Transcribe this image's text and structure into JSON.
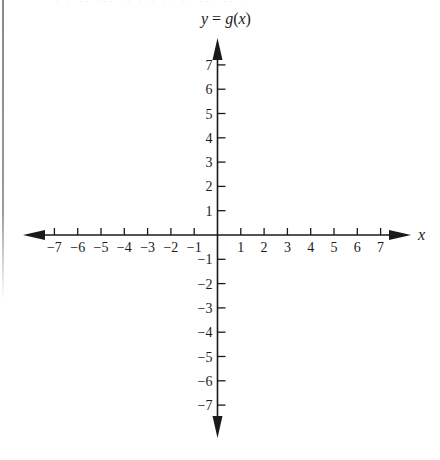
{
  "chart_data": {
    "type": "line",
    "title": "",
    "xlabel": "x",
    "ylabel": "y = g(x)",
    "xlim": [
      -7,
      7
    ],
    "ylim": [
      -7,
      7
    ],
    "x_ticks": [
      -7,
      -6,
      -5,
      -4,
      -3,
      -2,
      -1,
      1,
      2,
      3,
      4,
      5,
      6,
      7
    ],
    "y_ticks": [
      7,
      6,
      5,
      4,
      3,
      2,
      1,
      -1,
      -2,
      -3,
      -4,
      -5,
      -6,
      -7
    ],
    "x_tick_labels": [
      "−7",
      "−6",
      "−5",
      "−4",
      "−3",
      "−2",
      "−1",
      "1",
      "2",
      "3",
      "4",
      "5",
      "6",
      "7"
    ],
    "y_tick_labels": [
      "7",
      "6",
      "5",
      "4",
      "3",
      "2",
      "1",
      "−1",
      "−2",
      "−3",
      "−4",
      "−5",
      "−6",
      "−7"
    ],
    "series": [],
    "grid": false,
    "legend": null,
    "arrows": {
      "x_axis": "both-ends",
      "y_axis": "both-ends"
    }
  },
  "axes": {
    "x_label": "x",
    "y_label_parts": {
      "lhs": "y",
      "eq": " = ",
      "fn": "g",
      "paren_open": "(",
      "var": "x",
      "paren_close": ")"
    }
  },
  "layout": {
    "origin_px": [
      217.5,
      235
    ],
    "unit_x_px": 23.3,
    "unit_y_px": 24.3,
    "x_arrow_left_tip": 23,
    "x_arrow_right_tip": 411,
    "y_arrow_top_tip": 38,
    "y_arrow_bottom_tip": 438,
    "stroke": "#1a1a1a"
  }
}
